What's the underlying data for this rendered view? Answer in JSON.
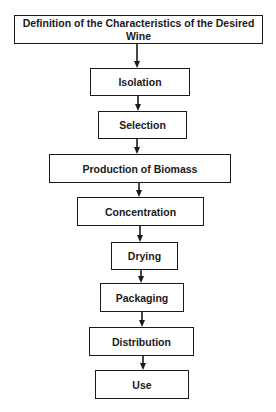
{
  "diagram": {
    "type": "flowchart",
    "direction": "top-to-bottom",
    "colors": {
      "stroke": "#1a1a1a",
      "fill": "#ffffff",
      "text": "#1a1a1a"
    },
    "steps": [
      {
        "id": "definition",
        "label": "Definition of the Characteristics of the Desired Wine"
      },
      {
        "id": "isolation",
        "label": "Isolation"
      },
      {
        "id": "selection",
        "label": "Selection"
      },
      {
        "id": "production",
        "label": "Production of Biomass"
      },
      {
        "id": "concentration",
        "label": "Concentration"
      },
      {
        "id": "drying",
        "label": "Drying"
      },
      {
        "id": "packaging",
        "label": "Packaging"
      },
      {
        "id": "distribution",
        "label": "Distribution"
      },
      {
        "id": "use",
        "label": "Use"
      }
    ],
    "edges": [
      {
        "from": "definition",
        "to": "isolation"
      },
      {
        "from": "isolation",
        "to": "selection"
      },
      {
        "from": "selection",
        "to": "production"
      },
      {
        "from": "production",
        "to": "concentration"
      },
      {
        "from": "concentration",
        "to": "drying"
      },
      {
        "from": "drying",
        "to": "packaging"
      },
      {
        "from": "packaging",
        "to": "distribution"
      },
      {
        "from": "distribution",
        "to": "use"
      }
    ]
  }
}
